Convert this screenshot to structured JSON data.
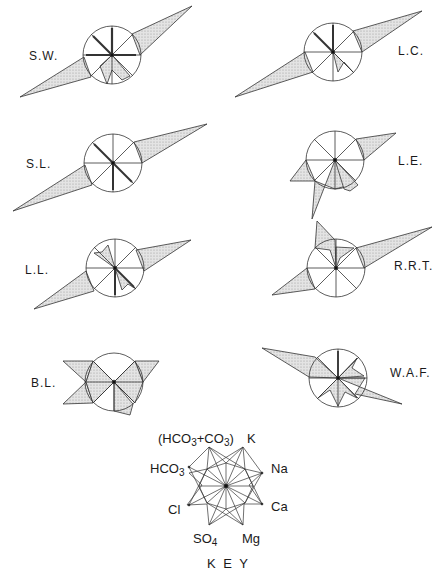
{
  "figure": {
    "panels": [
      {
        "id": "sw",
        "label": "S.W.",
        "cx": 112,
        "cy": 55
      },
      {
        "id": "lc",
        "label": "L.C.",
        "cx": 333,
        "cy": 52
      },
      {
        "id": "sl",
        "label": "S.L.",
        "cx": 113,
        "cy": 163
      },
      {
        "id": "le",
        "label": "L.E.",
        "cx": 335,
        "cy": 160
      },
      {
        "id": "ll",
        "label": "L.L.",
        "cx": 115,
        "cy": 268
      },
      {
        "id": "rrt",
        "label": "R.R.T.",
        "cx": 336,
        "cy": 268
      },
      {
        "id": "bl",
        "label": "B.L.",
        "cx": 114,
        "cy": 382
      },
      {
        "id": "waf",
        "label": "W.A.F.",
        "cx": 338,
        "cy": 378
      }
    ],
    "key": {
      "title": "K E Y",
      "axes": {
        "top_left": "(HCO3+CO3)",
        "top_right": "K",
        "right_upper": "Na",
        "right_lower": "Ca",
        "bottom_right": "Mg",
        "bottom_left": "SO4",
        "left_lower": "Cl",
        "left_upper": "HCO3"
      },
      "hco3_co3_open": "(HCO",
      "hco3_co3_sub1": "3",
      "hco3_co3_plus": "+CO",
      "hco3_co3_sub2": "3",
      "hco3_co3_close": ")",
      "hco3_base": "HCO",
      "hco3_sub": "3",
      "so4_base": "SO",
      "so4_sub": "4",
      "k": "K",
      "na": "Na",
      "ca": "Ca",
      "mg": "Mg",
      "cl": "Cl"
    },
    "colors": {
      "line": "#333333",
      "fill": "#d9d9d9",
      "background": "#ffffff"
    }
  }
}
